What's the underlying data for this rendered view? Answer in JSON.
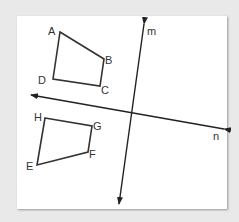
{
  "figure": {
    "lines": [
      {
        "name": "m",
        "label": "m"
      },
      {
        "name": "n",
        "label": "n"
      }
    ],
    "quadrilateral_top": {
      "vertices": [
        "A",
        "B",
        "C",
        "D"
      ]
    },
    "quadrilateral_bottom": {
      "vertices": [
        "E",
        "F",
        "G",
        "H"
      ]
    },
    "labels": {
      "A": "A",
      "B": "B",
      "C": "C",
      "D": "D",
      "E": "E",
      "F": "F",
      "G": "G",
      "H": "H",
      "m": "m",
      "n": "n"
    }
  }
}
